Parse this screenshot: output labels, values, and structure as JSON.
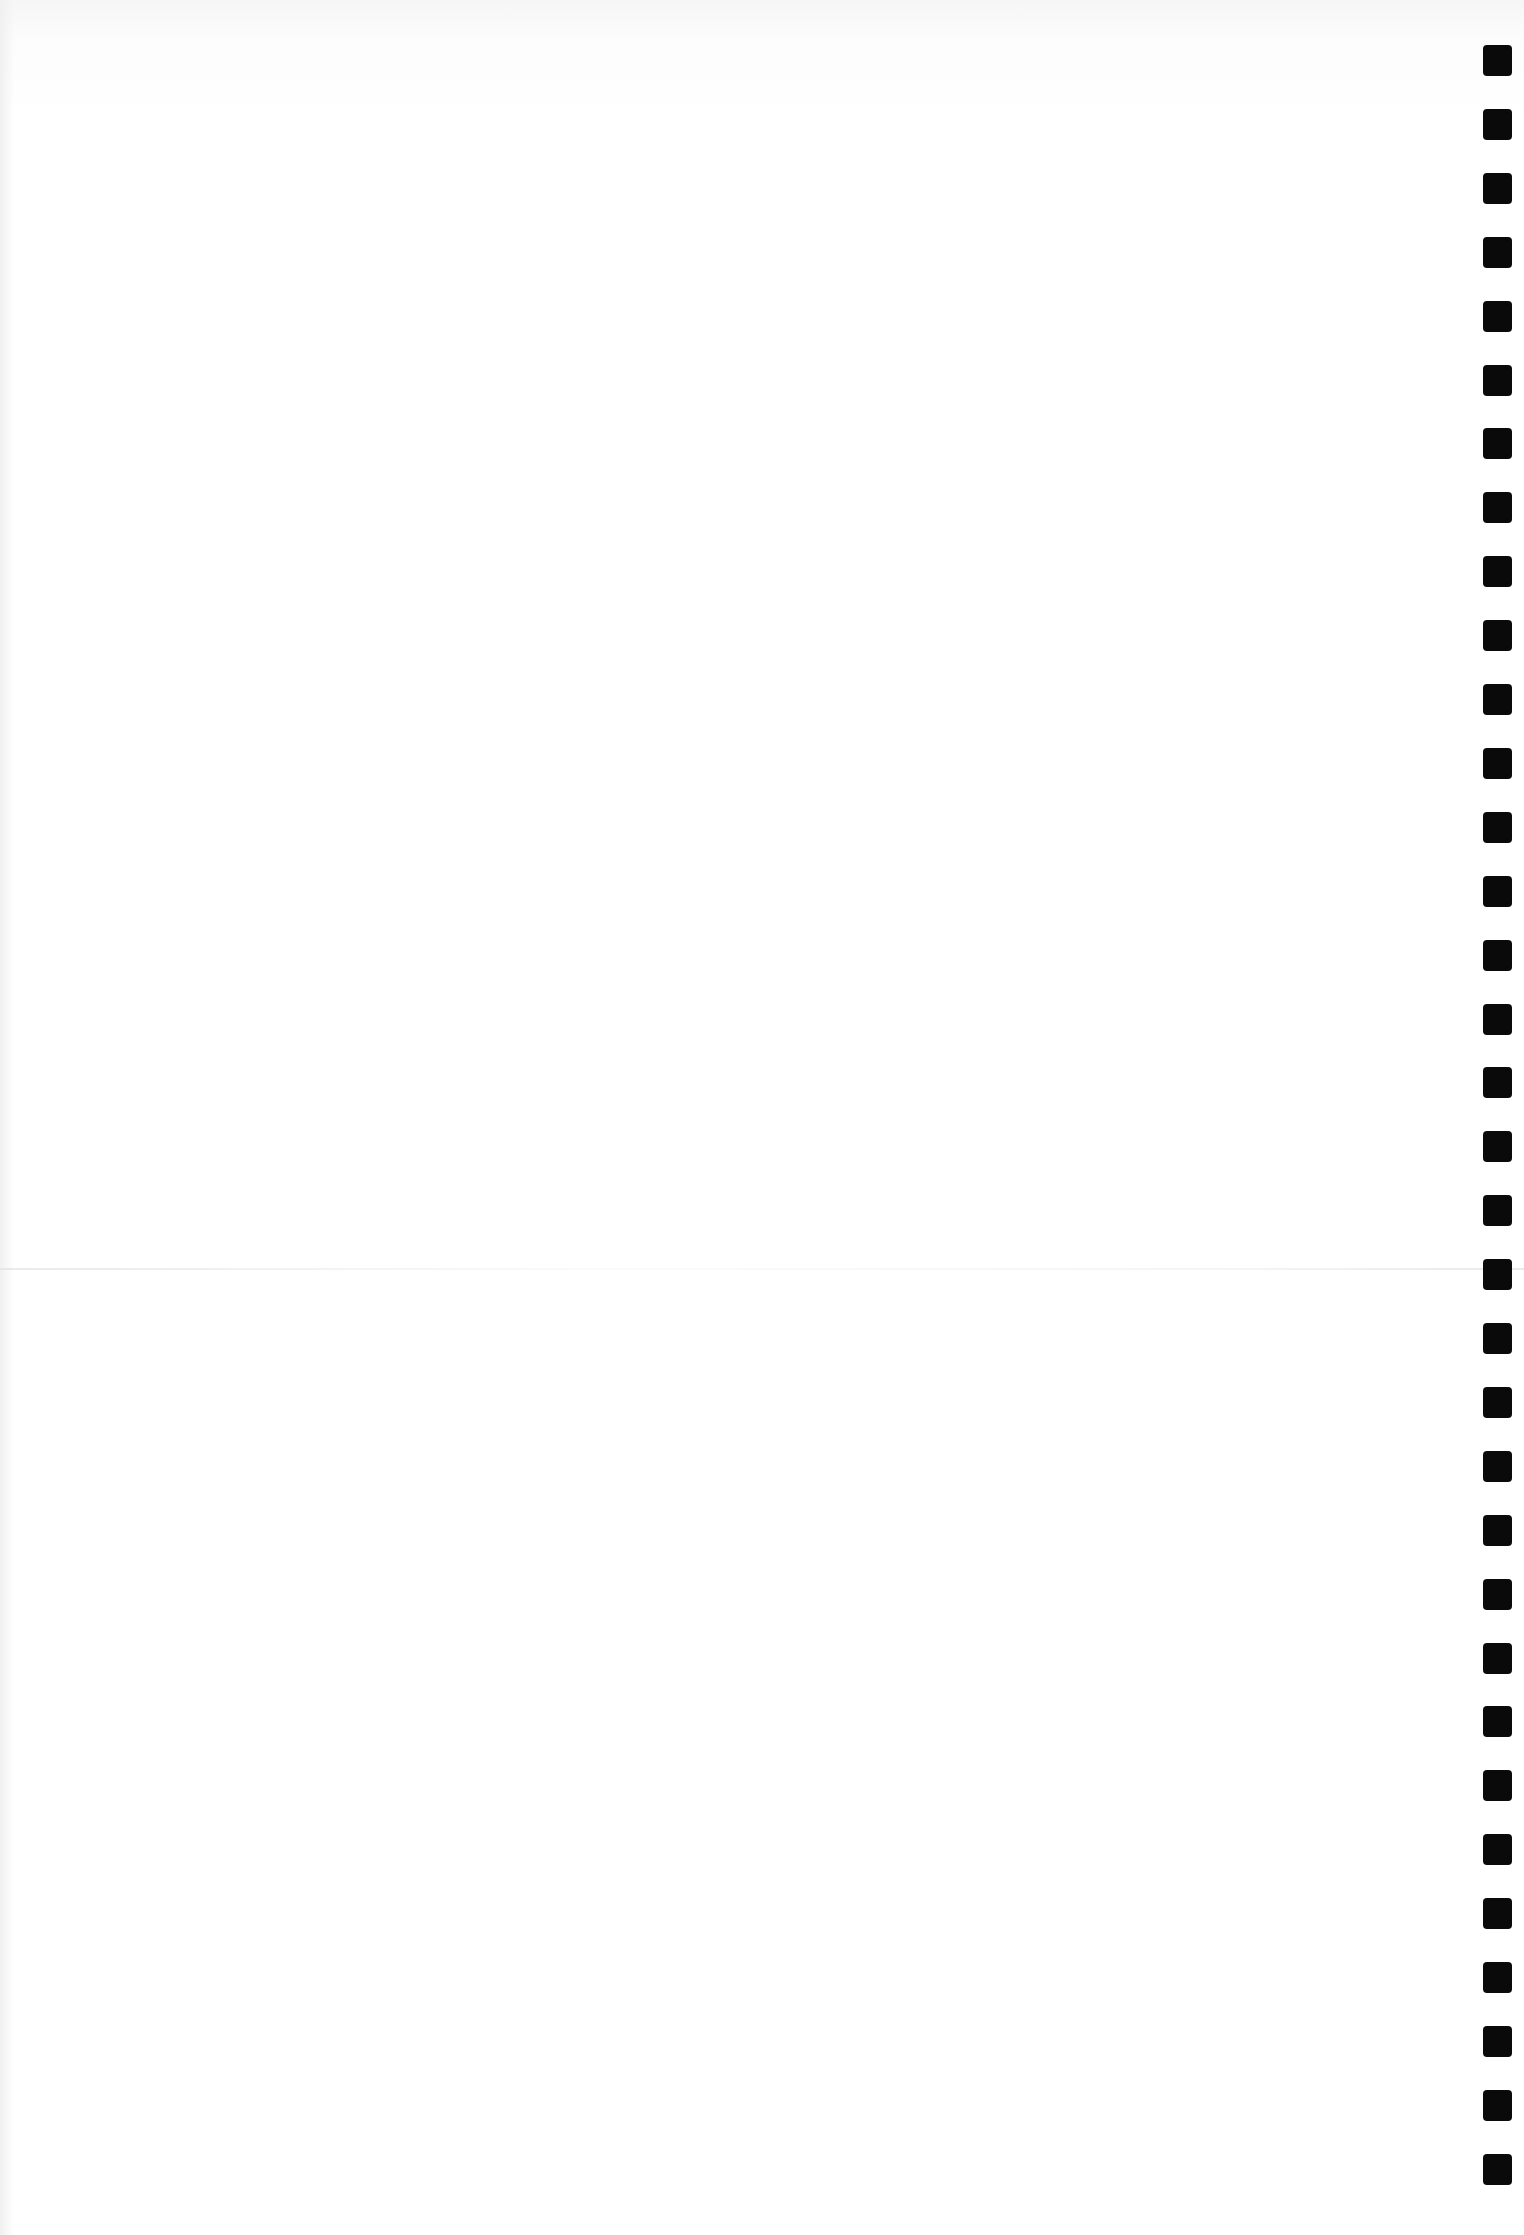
{
  "document": {
    "type": "blank punched page",
    "content_text": "",
    "bleed_through_text_legible": false
  },
  "binding_holes": {
    "count": 34,
    "x": 1483,
    "first_y": 45,
    "pitch": 63.9,
    "width": 29,
    "height": 31,
    "color": "#0a0a0a"
  },
  "fold": {
    "y": 1268
  },
  "colors": {
    "paper": "#ffffff",
    "paper_top_tint": "#f6f6f6"
  }
}
